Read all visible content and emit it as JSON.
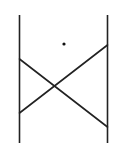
{
  "diagram": {
    "width": 120,
    "height": 143,
    "background": "#ffffff",
    "stroke_color": "#222222",
    "stroke_width": 1.6,
    "vertical_lines": [
      {
        "name": "left-post",
        "x": 19.5,
        "y1": 15,
        "y2": 143
      },
      {
        "name": "right-post",
        "x": 107.5,
        "y1": 15,
        "y2": 143
      }
    ],
    "cross_lines": [
      {
        "name": "descending-diagonal",
        "x1": 19.5,
        "y1": 59,
        "x2": 107.5,
        "y2": 127
      },
      {
        "name": "ascending-diagonal",
        "x1": 19.5,
        "y1": 113,
        "x2": 107.5,
        "y2": 45
      }
    ],
    "dot": {
      "cx": 64,
      "cy": 44,
      "r": 1.6,
      "color": "#111111"
    }
  }
}
